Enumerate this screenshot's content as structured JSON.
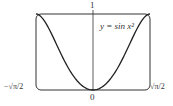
{
  "chart_data": {
    "type": "line",
    "title": "",
    "xlabel": "",
    "ylabel": "",
    "series": [
      {
        "name": "y = sin x^2",
        "x": [
          -1.2533,
          -1.1,
          -0.9,
          -0.7,
          -0.5,
          -0.3,
          0,
          0.3,
          0.5,
          0.7,
          0.9,
          1.1,
          1.2533
        ],
        "values": [
          1.0,
          0.9356,
          0.7243,
          0.4706,
          0.2474,
          0.0899,
          0.0,
          0.0899,
          0.2474,
          0.4706,
          0.7243,
          0.9356,
          1.0
        ]
      }
    ],
    "xlim": [
      -1.2533,
      1.2533
    ],
    "ylim": [
      0,
      1
    ],
    "x_tick_labels": [
      "−√π/2",
      "0",
      "√π/2"
    ],
    "y_tick_labels": [
      "1"
    ],
    "annotations": [
      "y = sin x²"
    ],
    "grid": false,
    "legend": "none"
  },
  "labels": {
    "y_top": "1",
    "x_origin": "0",
    "x_left": "−√π/2",
    "x_right": "√π/2",
    "curve_label": "y = sin x²"
  }
}
